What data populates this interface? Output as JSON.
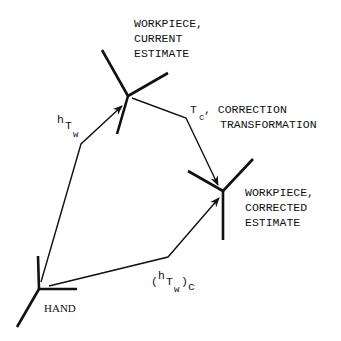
{
  "diagram": {
    "type": "coordinate-frame transformation diagram",
    "nodes": {
      "hand": {
        "label": "HAND",
        "center": [
          39,
          289
        ]
      },
      "workpiece_current": {
        "label_lines": [
          "WORKPIECE,",
          "CURRENT",
          "ESTIMATE"
        ],
        "center": [
          128,
          96
        ]
      },
      "workpiece_corrected": {
        "label_lines": [
          "WORKPIECE,",
          "CORRECTED",
          "ESTIMATE"
        ],
        "center": [
          223,
          191
        ]
      }
    },
    "edges": {
      "hTw": {
        "sup": "h",
        "main": "T",
        "sub": "w",
        "from": "hand",
        "to": "workpiece_current"
      },
      "Tc": {
        "main": "T",
        "sub": "c",
        "label_lines": [
          ", CORRECTION",
          "TRANSFORMATION"
        ],
        "from": "workpiece_current",
        "to": "workpiece_corrected"
      },
      "hTw_c": {
        "open": "(",
        "sup": "h",
        "main": "T",
        "sub": "w",
        "close": ")",
        "outer_sub": "c",
        "from": "hand",
        "to": "workpiece_corrected"
      }
    }
  }
}
